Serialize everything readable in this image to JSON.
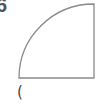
{
  "problem": {
    "number_label": "6",
    "answer_paren": "("
  },
  "figure": {
    "shape": "quarter-circle",
    "stroke_color": "#8a8a8a",
    "center": [
      94,
      78
    ],
    "radius": 75
  }
}
